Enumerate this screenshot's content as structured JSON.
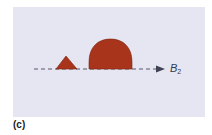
{
  "figure": {
    "panel_label": "(c)",
    "axis": {
      "label": "B",
      "subscript": "2"
    },
    "shapes": [
      {
        "name": "small-triangle-peak",
        "type": "triangle",
        "color": "#a8341b"
      },
      {
        "name": "large-dome-peak",
        "type": "dome",
        "color": "#a8341b"
      }
    ],
    "colors": {
      "background": "#e6e6f3",
      "fill": "#a8341b",
      "axis": "#55596a"
    }
  }
}
